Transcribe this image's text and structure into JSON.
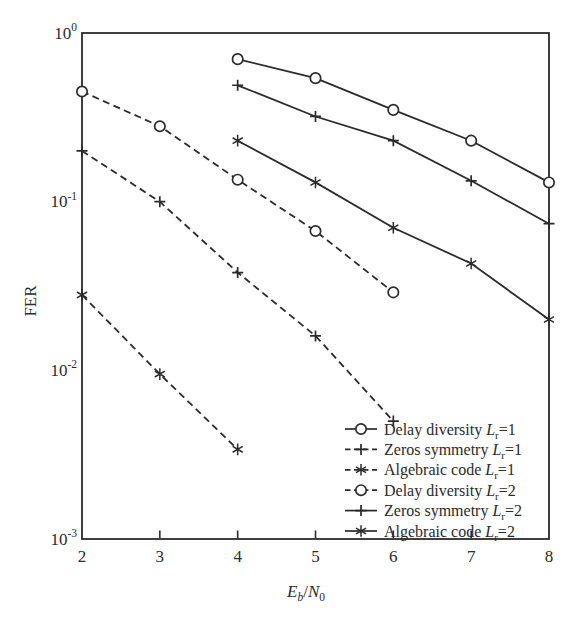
{
  "figure": {
    "background": "#ffffff",
    "ink_color": "#2b2b2b"
  },
  "chart_data": {
    "type": "line",
    "title": "",
    "xlabel": "Eb/N0",
    "xlabel_parts": {
      "var1": "E",
      "sub1": "b",
      "sep": "/",
      "var2": "N",
      "sub2": "0"
    },
    "ylabel": "FER",
    "xlim": [
      2,
      8
    ],
    "ylim": [
      0.001,
      1
    ],
    "yscale": "log",
    "grid": false,
    "legend_position": "lower-right",
    "x_ticks": [
      "2",
      "3",
      "4",
      "5",
      "6",
      "7",
      "8"
    ],
    "y_tick_base": "10",
    "y_tick_exponents": [
      "0",
      "-1",
      "-2",
      "-3"
    ],
    "series": [
      {
        "name": "Delay diversity Lr=1",
        "legend_prefix": "Delay diversity",
        "legend_var": "L",
        "legend_sub": "r",
        "legend_eq": "=1",
        "line_style": "solid",
        "marker": "circle",
        "x": [
          4,
          5,
          6,
          7,
          8
        ],
        "y": [
          0.7,
          0.54,
          0.35,
          0.23,
          0.13
        ]
      },
      {
        "name": "Zeros symmetry Lr=1",
        "legend_prefix": "Zeros symmetry",
        "legend_var": "L",
        "legend_sub": "r",
        "legend_eq": "=1",
        "line_style": "dashed",
        "marker": "plus",
        "x": [
          2,
          3,
          4,
          5,
          6
        ],
        "y": [
          0.2,
          0.1,
          0.038,
          0.016,
          0.005
        ]
      },
      {
        "name": "Algebraic code Lr=1",
        "legend_prefix": "Algebraic code",
        "legend_var": "L",
        "legend_sub": "r",
        "legend_eq": "=1",
        "line_style": "dashed",
        "marker": "asterisk",
        "x": [
          2,
          3,
          4
        ],
        "y": [
          0.028,
          0.0095,
          0.0034
        ]
      },
      {
        "name": "Delay diversity Lr=2",
        "legend_prefix": "Delay diversity",
        "legend_var": "L",
        "legend_sub": "r",
        "legend_eq": "=2",
        "line_style": "dashed",
        "marker": "circle",
        "x": [
          2,
          3,
          4,
          5,
          6
        ],
        "y": [
          0.45,
          0.28,
          0.135,
          0.067,
          0.029
        ]
      },
      {
        "name": "Zeros symmetry Lr=2",
        "legend_prefix": "Zeros symmetry",
        "legend_var": "L",
        "legend_sub": "r",
        "legend_eq": "=2",
        "line_style": "solid",
        "marker": "plus",
        "x": [
          4,
          5,
          6,
          7,
          8
        ],
        "y": [
          0.49,
          0.32,
          0.23,
          0.133,
          0.074
        ]
      },
      {
        "name": "Algebraic code Lr=2",
        "legend_prefix": "Algebraic code",
        "legend_var": "L",
        "legend_sub": "r",
        "legend_eq": "=2",
        "line_style": "solid",
        "marker": "asterisk",
        "x": [
          4,
          5,
          6,
          7,
          8
        ],
        "y": [
          0.23,
          0.13,
          0.07,
          0.043,
          0.02
        ]
      }
    ]
  }
}
